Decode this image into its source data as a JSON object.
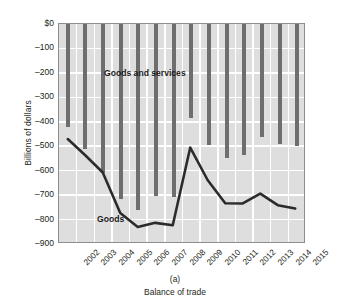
{
  "chart_data": {
    "type": "bar",
    "title": "",
    "subtitle": "",
    "panel_label": "(a)",
    "xlabel": "Balance of trade",
    "ylabel": "Billions of dollars",
    "categories": [
      "2002",
      "2003",
      "2004",
      "2005",
      "2006",
      "2007",
      "2008",
      "2009",
      "2010",
      "2011",
      "2012",
      "2013",
      "2014",
      "2015"
    ],
    "ylim": [
      -900,
      0
    ],
    "ytick_labels": [
      "$0",
      "–100",
      "–200",
      "–300",
      "–400",
      "–500",
      "–600",
      "–700",
      "–800",
      "–900"
    ],
    "ytick_values": [
      0,
      -100,
      -200,
      -300,
      -400,
      -500,
      -600,
      -700,
      -800,
      -900
    ],
    "grid": true,
    "legend": "none",
    "series": [
      {
        "name": "Goods and services",
        "render": "bar",
        "color": "#6e6e6e",
        "values": [
          -421,
          -512,
          -611,
          -715,
          -762,
          -705,
          -709,
          -384,
          -495,
          -549,
          -537,
          -462,
          -490,
          -500
        ]
      },
      {
        "name": "Goods",
        "render": "line",
        "color": "#2b2b2b",
        "values": [
          -475,
          -542,
          -613,
          -780,
          -838,
          -821,
          -831,
          -510,
          -645,
          -740,
          -741,
          -700,
          -748,
          -762
        ]
      }
    ],
    "annotations": [
      {
        "name": "goods-and-services-label",
        "text": "Goods and services"
      },
      {
        "name": "goods-label",
        "text": "Goods"
      }
    ]
  },
  "colors": {
    "plot_background": "#dedede",
    "gridline": "#ffffff",
    "bar": "#6e6e6e",
    "line": "#2b2b2b",
    "axis": "#8d8d8d",
    "text": "#231f20"
  }
}
